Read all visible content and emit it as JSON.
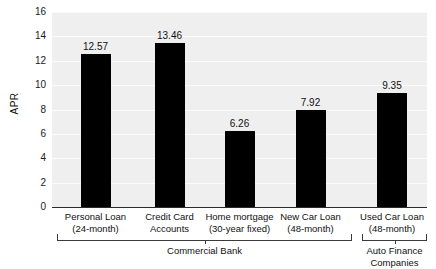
{
  "chart_data": {
    "type": "bar",
    "title": "",
    "subtitle": "",
    "xlabel": "",
    "ylabel": "APR",
    "ylim": [
      0,
      16
    ],
    "ytick_step": 2,
    "yticks": [
      "16",
      "14",
      "12",
      "10",
      "8",
      "6",
      "4",
      "2",
      "0"
    ],
    "grid": true,
    "grid_orientation": "horizontal",
    "legend": "none",
    "bar_color": "#000000",
    "plot_background": "#efefef",
    "categories": [
      "Personal Loan (24-month)",
      "Credit Card Accounts",
      "Home mortgage (30-year fixed)",
      "New Car Loan (48-month)",
      "Used Car Loan (48-month)"
    ],
    "values": [
      12.57,
      13.46,
      6.26,
      7.92,
      9.35
    ],
    "bars": [
      {
        "label_line1": "Personal Loan",
        "label_line2": "(24-month)",
        "value": 12.57,
        "value_text": "12.57",
        "group": "Commercial Bank"
      },
      {
        "label_line1": "Credit Card",
        "label_line2": "Accounts",
        "value": 13.46,
        "value_text": "13.46",
        "group": "Commercial Bank"
      },
      {
        "label_line1": "Home mortgage",
        "label_line2": "(30-year fixed)",
        "value": 6.26,
        "value_text": "6.26",
        "group": "Commercial Bank"
      },
      {
        "label_line1": "New Car Loan",
        "label_line2": "(48-month)",
        "value": 7.92,
        "value_text": "7.92",
        "group": "Commercial Bank"
      },
      {
        "label_line1": "Used Car Loan",
        "label_line2": "(48-month)",
        "value": 9.35,
        "value_text": "9.35",
        "group": "Auto Finance Companies"
      }
    ],
    "groups": [
      {
        "label_line1": "Commercial Bank",
        "label_line2": "",
        "bar_indices": [
          0,
          1,
          2,
          3
        ]
      },
      {
        "label_line1": "Auto Finance",
        "label_line2": "Companies",
        "bar_indices": [
          4
        ]
      }
    ]
  }
}
